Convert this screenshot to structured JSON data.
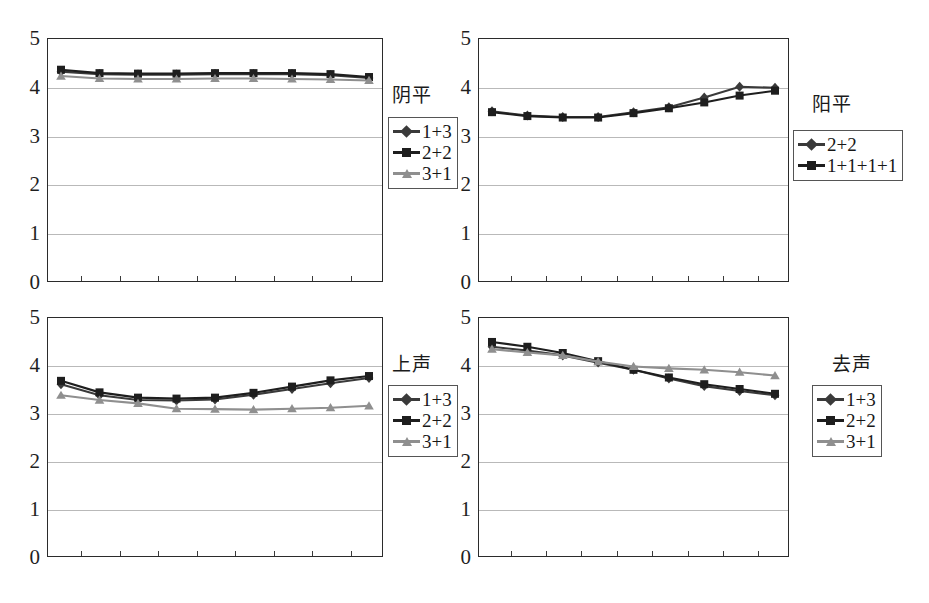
{
  "figure": {
    "background": "#ffffff",
    "axis_color": "#2b2b2b",
    "grid_color": "#b9b9b9"
  },
  "series_styles": {
    "s1": {
      "color": "#3a3a3a",
      "marker": "diamond"
    },
    "s2": {
      "color": "#1e1e1e",
      "marker": "square"
    },
    "s3": {
      "color": "#8f8f8f",
      "marker": "triangle"
    }
  },
  "yticks": [
    "0",
    "1",
    "2",
    "3",
    "4",
    "5"
  ],
  "chart_data": [
    {
      "type": "line",
      "title": "阴平",
      "xlabel": "",
      "ylabel": "",
      "ylim": [
        0,
        5
      ],
      "yticks": [
        0,
        1,
        2,
        3,
        4,
        5
      ],
      "grid": true,
      "legend_position": "right",
      "x": [
        1,
        2,
        3,
        4,
        5,
        6,
        7,
        8,
        9
      ],
      "series": [
        {
          "name": "1+3",
          "marker": "diamond",
          "color": "#3a3a3a",
          "values": [
            4.31,
            4.26,
            4.25,
            4.25,
            4.26,
            4.26,
            4.26,
            4.24,
            4.18
          ]
        },
        {
          "name": "2+2",
          "marker": "square",
          "color": "#1e1e1e",
          "values": [
            4.35,
            4.28,
            4.27,
            4.27,
            4.28,
            4.28,
            4.28,
            4.26,
            4.2
          ]
        },
        {
          "name": "3+1",
          "marker": "triangle",
          "color": "#8f8f8f",
          "values": [
            4.22,
            4.17,
            4.16,
            4.16,
            4.17,
            4.17,
            4.16,
            4.15,
            4.13
          ]
        }
      ]
    },
    {
      "type": "line",
      "title": "阳平",
      "xlabel": "",
      "ylabel": "",
      "ylim": [
        0,
        5
      ],
      "yticks": [
        0,
        1,
        2,
        3,
        4,
        5
      ],
      "grid": true,
      "legend_position": "right",
      "x": [
        1,
        2,
        3,
        4,
        5,
        6,
        7,
        8,
        9
      ],
      "series": [
        {
          "name": "2+2",
          "marker": "diamond",
          "color": "#3a3a3a",
          "values": [
            3.5,
            3.41,
            3.38,
            3.38,
            3.48,
            3.58,
            3.78,
            4.0,
            3.98
          ]
        },
        {
          "name": "1+1+1+1",
          "marker": "square",
          "color": "#1e1e1e",
          "values": [
            3.48,
            3.4,
            3.37,
            3.37,
            3.46,
            3.56,
            3.68,
            3.82,
            3.92
          ]
        }
      ]
    },
    {
      "type": "line",
      "title": "上声",
      "xlabel": "",
      "ylabel": "",
      "ylim": [
        0,
        5
      ],
      "yticks": [
        0,
        1,
        2,
        3,
        4,
        5
      ],
      "grid": true,
      "legend_position": "right",
      "x": [
        1,
        2,
        3,
        4,
        5,
        6,
        7,
        8,
        9
      ],
      "series": [
        {
          "name": "1+3",
          "marker": "diamond",
          "color": "#3a3a3a",
          "values": [
            3.6,
            3.37,
            3.27,
            3.26,
            3.28,
            3.38,
            3.5,
            3.62,
            3.73
          ]
        },
        {
          "name": "2+2",
          "marker": "square",
          "color": "#1e1e1e",
          "values": [
            3.67,
            3.43,
            3.32,
            3.3,
            3.32,
            3.42,
            3.55,
            3.68,
            3.77
          ]
        },
        {
          "name": "3+1",
          "marker": "triangle",
          "color": "#8f8f8f",
          "values": [
            3.37,
            3.27,
            3.2,
            3.09,
            3.08,
            3.07,
            3.09,
            3.11,
            3.15
          ]
        }
      ]
    },
    {
      "type": "line",
      "title": "去声",
      "xlabel": "",
      "ylabel": "",
      "ylim": [
        0,
        5
      ],
      "yticks": [
        0,
        1,
        2,
        3,
        4,
        5
      ],
      "grid": true,
      "legend_position": "right",
      "x": [
        1,
        2,
        3,
        4,
        5,
        6,
        7,
        8,
        9
      ],
      "series": [
        {
          "name": "1+3",
          "marker": "diamond",
          "color": "#3a3a3a",
          "values": [
            4.38,
            4.3,
            4.2,
            4.05,
            3.9,
            3.72,
            3.56,
            3.46,
            3.37
          ]
        },
        {
          "name": "2+2",
          "marker": "square",
          "color": "#1e1e1e",
          "values": [
            4.48,
            4.38,
            4.25,
            4.08,
            3.9,
            3.74,
            3.6,
            3.5,
            3.4
          ]
        },
        {
          "name": "3+1",
          "marker": "triangle",
          "color": "#8f8f8f",
          "values": [
            4.33,
            4.26,
            4.2,
            4.07,
            3.97,
            3.93,
            3.9,
            3.85,
            3.78
          ]
        }
      ]
    }
  ],
  "panels": [
    {
      "caption": "阴平",
      "legend": [
        "1+3",
        "2+2",
        "3+1"
      ]
    },
    {
      "caption": "阳平",
      "legend": [
        "2+2",
        "1+1+1+1"
      ]
    },
    {
      "caption": "上声",
      "legend": [
        "1+3",
        "2+2",
        "3+1"
      ]
    },
    {
      "caption": "去声",
      "legend": [
        "1+3",
        "2+2",
        "3+1"
      ]
    }
  ]
}
